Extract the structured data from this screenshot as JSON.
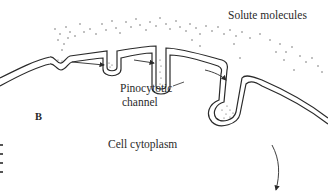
{
  "figure": {
    "panel_label": "B",
    "labels": {
      "solute": "Solute molecules",
      "channel_line1": "Pinocytotic",
      "channel_line2": "channel",
      "cytoplasm": "Cell cytoplasm"
    },
    "colors": {
      "line": "#2a2a2a",
      "dots": "#555555",
      "background": "#ffffff"
    },
    "elements": [
      "curved double plasma membrane",
      "shallow membrane invagination with solute",
      "medium invagination with solute",
      "deep pinocytotic channel",
      "pinocytotic vesicle pinching off",
      "arrows showing progression",
      "arrow pointing into cytoplasm"
    ]
  }
}
